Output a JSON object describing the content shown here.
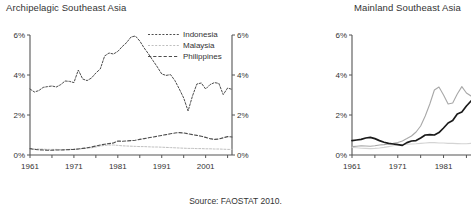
{
  "figure": {
    "source_note": "Source: FAOSTAT 2010."
  },
  "panels": {
    "archipelagic": {
      "title": "Archipelagic Southeast Asia",
      "legend": [
        {
          "label": "Indonesia",
          "color": "#4d4d4d",
          "dash": "2,1.6",
          "width": 1.0
        },
        {
          "label": "Malaysia",
          "color": "#bfbfbf",
          "dash": "2,1.6",
          "width": 1.0
        },
        {
          "label": "Philippines",
          "color": "#4d4d4d",
          "dash": "3.2,2",
          "width": 1.1
        }
      ],
      "axis": {
        "y_ticks": [
          "0%",
          "2%",
          "4%",
          "6%"
        ],
        "y_tick_values": [
          0,
          2,
          4,
          6
        ],
        "x_ticks": [
          "1961",
          "1971",
          "1981",
          "1991",
          "2001"
        ],
        "x_tick_values": [
          1961,
          1971,
          1981,
          1991,
          2001
        ],
        "right_axis": true
      }
    },
    "mainland": {
      "title": "Mainland Southeast Asia",
      "legend": [
        {
          "label": "Burma",
          "color": "#d4d4d4",
          "dash": "0",
          "width": 1.1
        },
        {
          "label": "Thailand",
          "color": "#a8a8a8",
          "dash": "0",
          "width": 1.1
        },
        {
          "label": "Vietnam",
          "color": "#1a1a1a",
          "dash": "0",
          "width": 1.7
        }
      ],
      "axis": {
        "y_ticks": [
          "0%",
          "2%",
          "4%",
          "6%"
        ],
        "y_tick_values": [
          0,
          2,
          4,
          6
        ],
        "x_ticks": [
          "1961",
          "1971",
          "1981"
        ],
        "x_tick_values": [
          1961,
          1971,
          1981
        ],
        "right_axis": false
      }
    }
  },
  "chart_data": [
    {
      "type": "line",
      "title": "Archipelagic Southeast Asia",
      "xlabel": "",
      "ylabel": "",
      "ylim": [
        0,
        6
      ],
      "xlim": [
        1961,
        2007
      ],
      "grid": false,
      "legend_position": "upper-right-inside",
      "y_tick_labels": [
        "0%",
        "2%",
        "4%",
        "6%"
      ],
      "x_tick_labels": [
        "1961",
        "1971",
        "1981",
        "1991",
        "2001"
      ],
      "x": [
        1961,
        1962,
        1963,
        1964,
        1965,
        1966,
        1967,
        1968,
        1969,
        1970,
        1971,
        1972,
        1973,
        1974,
        1975,
        1976,
        1977,
        1978,
        1979,
        1980,
        1981,
        1982,
        1983,
        1984,
        1985,
        1986,
        1987,
        1988,
        1989,
        1990,
        1991,
        1992,
        1993,
        1994,
        1995,
        1996,
        1997,
        1998,
        1999,
        2000,
        2001,
        2002,
        2003,
        2004,
        2005,
        2006,
        2007
      ],
      "series": [
        {
          "name": "Indonesia",
          "values": [
            3.3,
            3.15,
            3.22,
            3.38,
            3.42,
            3.45,
            3.4,
            3.52,
            3.7,
            3.68,
            3.62,
            4.25,
            3.8,
            3.72,
            3.85,
            4.1,
            4.3,
            4.95,
            5.1,
            5.05,
            5.18,
            5.42,
            5.62,
            5.9,
            5.95,
            5.7,
            5.35,
            5.05,
            4.72,
            4.4,
            4.05,
            3.98,
            4.02,
            3.72,
            3.3,
            2.85,
            2.2,
            2.95,
            3.55,
            3.6,
            3.3,
            3.52,
            3.62,
            3.58,
            3.02,
            3.35,
            3.28
          ]
        },
        {
          "name": "Malaysia",
          "values": [
            0.33,
            0.3,
            0.3,
            0.29,
            0.28,
            0.28,
            0.28,
            0.27,
            0.27,
            0.28,
            0.29,
            0.3,
            0.32,
            0.34,
            0.36,
            0.4,
            0.45,
            0.48,
            0.5,
            0.5,
            0.48,
            0.46,
            0.45,
            0.44,
            0.43,
            0.42,
            0.42,
            0.41,
            0.4,
            0.4,
            0.39,
            0.38,
            0.37,
            0.36,
            0.35,
            0.34,
            0.33,
            0.33,
            0.32,
            0.32,
            0.31,
            0.31,
            0.3,
            0.3,
            0.29,
            0.28,
            0.28
          ]
        },
        {
          "name": "Philippines",
          "values": [
            0.32,
            0.28,
            0.26,
            0.25,
            0.24,
            0.24,
            0.25,
            0.25,
            0.26,
            0.27,
            0.28,
            0.3,
            0.33,
            0.36,
            0.4,
            0.45,
            0.5,
            0.54,
            0.57,
            0.6,
            0.7,
            0.69,
            0.7,
            0.72,
            0.74,
            0.78,
            0.82,
            0.86,
            0.9,
            0.94,
            0.98,
            1.02,
            1.06,
            1.1,
            1.12,
            1.1,
            1.06,
            1.02,
            0.98,
            0.94,
            0.88,
            0.82,
            0.78,
            0.8,
            0.86,
            0.92,
            0.9
          ]
        }
      ]
    },
    {
      "type": "line",
      "title": "Mainland Southeast Asia",
      "xlabel": "",
      "ylabel": "",
      "ylim": [
        0,
        6
      ],
      "xlim": [
        1961,
        1987
      ],
      "grid": false,
      "legend_position": "upper-right-inside",
      "y_tick_labels": [
        "0%",
        "2%",
        "4%",
        "6%"
      ],
      "x_tick_labels": [
        "1961",
        "1971",
        "1981"
      ],
      "x": [
        1961,
        1962,
        1963,
        1964,
        1965,
        1966,
        1967,
        1968,
        1969,
        1970,
        1971,
        1972,
        1973,
        1974,
        1975,
        1976,
        1977,
        1978,
        1979,
        1980,
        1981,
        1982,
        1983,
        1984,
        1985,
        1986,
        1987
      ],
      "series": [
        {
          "name": "Burma",
          "values": [
            0.38,
            0.36,
            0.34,
            0.33,
            0.32,
            0.33,
            0.35,
            0.38,
            0.42,
            0.46,
            0.5,
            0.52,
            0.54,
            0.55,
            0.56,
            0.58,
            0.6,
            0.62,
            0.62,
            0.6,
            0.6,
            0.58,
            0.58,
            0.57,
            0.56,
            0.56,
            0.58
          ]
        },
        {
          "name": "Thailand",
          "values": [
            0.42,
            0.44,
            0.46,
            0.45,
            0.44,
            0.46,
            0.5,
            0.52,
            0.55,
            0.58,
            0.62,
            0.7,
            0.82,
            0.95,
            1.15,
            1.45,
            1.95,
            2.55,
            3.25,
            3.4,
            3.0,
            2.55,
            2.6,
            3.05,
            3.42,
            3.1,
            2.95
          ]
        },
        {
          "name": "Vietnam",
          "values": [
            0.72,
            0.75,
            0.78,
            0.85,
            0.88,
            0.82,
            0.72,
            0.64,
            0.58,
            0.55,
            0.52,
            0.48,
            0.62,
            0.7,
            0.72,
            0.85,
            1.0,
            1.02,
            1.0,
            1.12,
            1.35,
            1.6,
            1.72,
            2.05,
            2.15,
            2.45,
            2.7
          ]
        }
      ]
    }
  ]
}
